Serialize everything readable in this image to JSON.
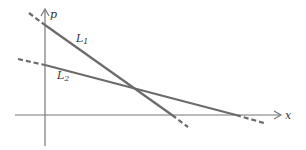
{
  "diagram": {
    "type": "supply-demand-lines",
    "axes": {
      "x_label": "x",
      "y_label": "p"
    },
    "lines": [
      {
        "name": "L1",
        "label_main": "L",
        "label_sub": "1",
        "color": "#6b6b6b"
      },
      {
        "name": "L2",
        "label_main": "L",
        "label_sub": "2",
        "color": "#6b6b6b"
      }
    ],
    "colors": {
      "axis": "#777777",
      "line": "#6b6b6b",
      "background": "#ffffff"
    }
  }
}
